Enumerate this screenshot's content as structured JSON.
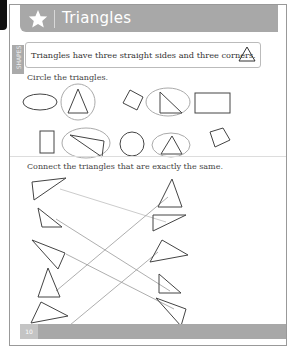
{
  "header": {
    "title": "Triangles",
    "icon": "star-icon"
  },
  "side_tab": {
    "label": "SHAPES"
  },
  "info": {
    "text": "Triangles have three straight sides and three corners."
  },
  "section1": {
    "instruction": "Circle the triangles.",
    "shapes": [
      {
        "shape": "oval",
        "circled": false
      },
      {
        "shape": "triangle",
        "circled": true
      },
      {
        "shape": "square",
        "circled": false
      },
      {
        "shape": "right-triangle",
        "circled": true
      },
      {
        "shape": "rectangle",
        "circled": false
      },
      {
        "shape": "rectangle-tall",
        "circled": false
      },
      {
        "shape": "scalene-triangle",
        "circled": true
      },
      {
        "shape": "circle",
        "circled": false
      },
      {
        "shape": "triangle",
        "circled": true
      },
      {
        "shape": "square",
        "circled": false
      }
    ]
  },
  "section2": {
    "instruction": "Connect the triangles that are exactly the same.",
    "matches": [
      [
        0,
        1
      ],
      [
        1,
        4
      ],
      [
        2,
        3
      ],
      [
        3,
        0
      ],
      [
        4,
        2
      ]
    ]
  },
  "footer": {
    "page_number": "10"
  },
  "colors": {
    "header": "#a8a8a8",
    "stroke": "#444444",
    "circle": "#aaaaaa",
    "line": "#999999"
  }
}
